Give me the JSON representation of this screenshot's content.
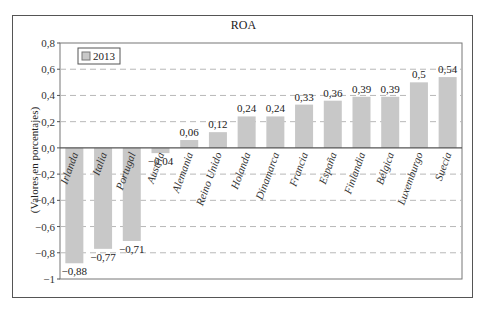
{
  "chart_data": {
    "type": "bar",
    "title": "ROA",
    "xlabel": "",
    "ylabel": "(Valores en porcentajes)",
    "ylim": [
      -1,
      0.8
    ],
    "yticks": [
      "0,8",
      "0,6",
      "0,4",
      "0,2",
      "0,0",
      "-0,2",
      "-0,4",
      "-0,6",
      "-0,8",
      "-1"
    ],
    "ytick_values": [
      0.8,
      0.6,
      0.4,
      0.2,
      0.0,
      -0.2,
      -0.4,
      -0.6,
      -0.8,
      -1
    ],
    "grid": "horizontal dashed",
    "legend": {
      "position": "top-left",
      "entries": [
        "2013"
      ]
    },
    "categories": [
      "Irlanda",
      "Italia",
      "Portugal",
      "Austria",
      "Alemania",
      "Reino Unido",
      "Holanda",
      "Dinamarca",
      "Francia",
      "España",
      "Finlandia",
      "Bélgica",
      "Luxemburgo",
      "Suecia"
    ],
    "series": [
      {
        "name": "2013",
        "values": [
          -0.88,
          -0.77,
          -0.71,
          -0.04,
          0.06,
          0.12,
          0.24,
          0.24,
          0.33,
          0.36,
          0.39,
          0.39,
          0.5,
          0.54
        ],
        "labels": [
          "-0,88",
          "-0,77",
          "-0,71",
          "-0,04",
          "0,06",
          "0,12",
          "0,24",
          "0,24",
          "0,33",
          "0,36",
          "0,39",
          "0,39",
          "0,5",
          "0,54"
        ]
      }
    ],
    "colors": {
      "bar": "#c8c8c8",
      "axis": "#555555",
      "grid": "#b8b8b8"
    }
  }
}
